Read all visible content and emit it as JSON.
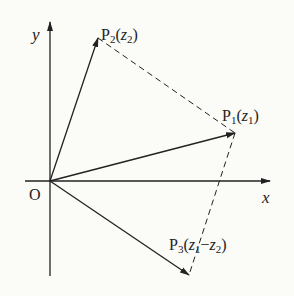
{
  "diagram": {
    "type": "complex-plane-vector-diagram",
    "axes": {
      "x_label": "x",
      "y_label": "y",
      "origin_label": "O"
    },
    "points": [
      {
        "id": "P1",
        "name": "P",
        "sub": "1",
        "arg": "z",
        "arg_sub": "1",
        "label": "P₁(z₁)"
      },
      {
        "id": "P2",
        "name": "P",
        "sub": "2",
        "arg": "z",
        "arg_sub": "2",
        "label": "P₂(z₂)"
      },
      {
        "id": "P3",
        "name": "P",
        "sub": "3",
        "arg": "z",
        "arg_sub": "1",
        "arg2": "z",
        "arg2_sub": "2",
        "op": "−",
        "label": "P₃(z₁−z₂)"
      }
    ],
    "vectors": [
      "OP1",
      "OP2",
      "OP3"
    ],
    "dashed_segments": [
      "P2P1",
      "P1P3"
    ],
    "colors": {
      "ink": "#222222",
      "background": "#fbfbf8"
    }
  }
}
